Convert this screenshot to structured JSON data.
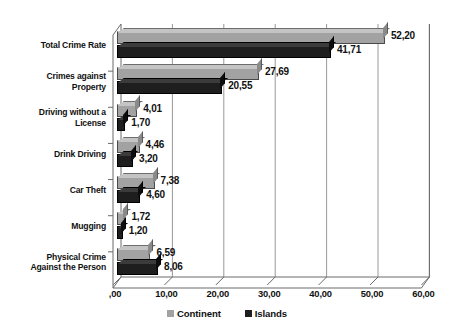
{
  "chart_data": {
    "type": "bar",
    "orientation": "horizontal",
    "style": "3d-clustered-bar",
    "title": "",
    "subtitle": "",
    "xlabel": "",
    "ylabel": "",
    "xlim": [
      0,
      60
    ],
    "grid": true,
    "grid_axis": "x",
    "decimal_separator": ",",
    "legend_position": "bottom",
    "categories": [
      "Total Crime Rate",
      "Crimes against Property",
      "Driving without a License",
      "Drink Driving",
      "Car Theft",
      "Mugging",
      "Physical Crime Against the Person"
    ],
    "category_label_lines": [
      [
        "Total Crime Rate"
      ],
      [
        "Crimes against",
        "Property"
      ],
      [
        "Driving without a",
        "License"
      ],
      [
        "Drink Driving"
      ],
      [
        "Car Theft"
      ],
      [
        "Mugging"
      ],
      [
        "Physical Crime",
        "Against the Person"
      ]
    ],
    "series": [
      {
        "name": "Continent",
        "color": "#a2a2a2",
        "values": [
          52.2,
          27.69,
          4.01,
          4.46,
          7.38,
          1.72,
          6.59
        ],
        "labels": [
          "52,20",
          "27,69",
          "4,01",
          "4,46",
          "7,38",
          "1,72",
          "6,59"
        ]
      },
      {
        "name": "Islands",
        "color": "#1e1e1e",
        "values": [
          41.71,
          20.55,
          1.7,
          3.2,
          4.6,
          1.2,
          8.06
        ],
        "labels": [
          "41,71",
          "20,55",
          "1,70",
          "3,20",
          "4,60",
          "1,20",
          "8,06"
        ]
      }
    ],
    "xticks": [
      0,
      10,
      20,
      30,
      40,
      50,
      60
    ],
    "xtick_labels": [
      ",00",
      "10,00",
      "20,00",
      "30,00",
      "40,00",
      "50,00",
      "60,00"
    ]
  },
  "legend": {
    "items": [
      {
        "label": "Continent",
        "color": "#a2a2a2"
      },
      {
        "label": "Islands",
        "color": "#1e1e1e"
      }
    ]
  },
  "colors": {
    "continent": "#a2a2a2",
    "islands": "#1e1e1e",
    "axis": "#555555",
    "grid": "#8c8c8c",
    "text": "#111111",
    "background": "#ffffff"
  }
}
